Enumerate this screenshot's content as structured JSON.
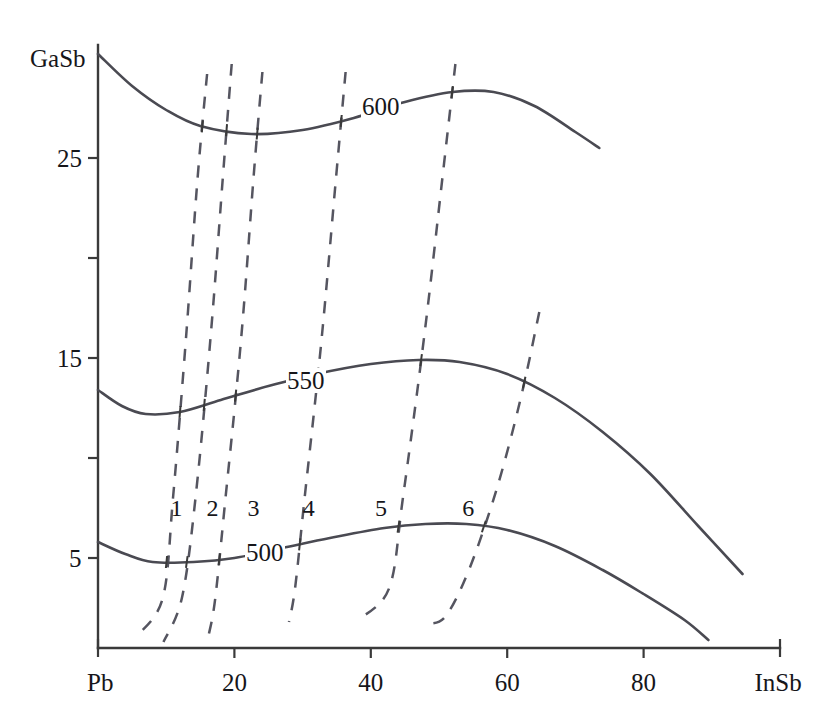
{
  "chart_data": {
    "type": "line",
    "title": "",
    "subtitle": "",
    "xlabel": "",
    "ylabel": "",
    "xlim": [
      0,
      100
    ],
    "ylim": [
      0.5,
      30.5
    ],
    "grid": false,
    "legend_position": "inline-on-curve",
    "x_axis": {
      "start_label": "Pb",
      "end_label": "InSb",
      "tick_labels": [
        "20",
        "40",
        "60",
        "80"
      ],
      "tick_values": [
        20,
        40,
        60,
        80
      ],
      "minor_ticks": []
    },
    "y_axis": {
      "top_label": "GaSb",
      "tick_labels": [
        "25",
        "15",
        "5"
      ],
      "tick_values": [
        25,
        15,
        5
      ],
      "unlabeled_tick_values": [
        20,
        10
      ]
    },
    "series": [
      {
        "name": "600",
        "label": "600",
        "style": "solid",
        "points": [
          [
            0.0,
            30.2
          ],
          [
            5.0,
            28.6
          ],
          [
            10.0,
            27.4
          ],
          [
            15.0,
            26.6
          ],
          [
            22.5,
            26.2
          ],
          [
            30.0,
            26.4
          ],
          [
            37.5,
            27.0
          ],
          [
            45.0,
            27.8
          ],
          [
            52.0,
            28.3
          ],
          [
            58.0,
            28.3
          ],
          [
            64.0,
            27.6
          ],
          [
            70.0,
            26.3
          ],
          [
            73.5,
            25.5
          ]
        ]
      },
      {
        "name": "550",
        "label": "550",
        "style": "solid",
        "points": [
          [
            0.0,
            13.4
          ],
          [
            3.5,
            12.6
          ],
          [
            7.0,
            12.2
          ],
          [
            12.0,
            12.3
          ],
          [
            18.0,
            12.9
          ],
          [
            25.0,
            13.6
          ],
          [
            32.0,
            14.2
          ],
          [
            40.0,
            14.7
          ],
          [
            47.0,
            14.9
          ],
          [
            53.0,
            14.8
          ],
          [
            60.0,
            14.2
          ],
          [
            67.0,
            13.0
          ],
          [
            74.0,
            11.3
          ],
          [
            81.0,
            9.2
          ],
          [
            88.0,
            6.6
          ],
          [
            94.5,
            4.2
          ]
        ]
      },
      {
        "name": "500",
        "label": "500",
        "style": "solid",
        "points": [
          [
            0.0,
            5.8
          ],
          [
            4.0,
            5.2
          ],
          [
            8.0,
            4.8
          ],
          [
            14.0,
            4.8
          ],
          [
            20.0,
            5.0
          ],
          [
            27.0,
            5.5
          ],
          [
            34.0,
            6.0
          ],
          [
            42.0,
            6.5
          ],
          [
            48.0,
            6.7
          ],
          [
            54.0,
            6.7
          ],
          [
            60.0,
            6.4
          ],
          [
            67.0,
            5.6
          ],
          [
            74.0,
            4.4
          ],
          [
            80.0,
            3.2
          ],
          [
            86.0,
            1.9
          ],
          [
            89.5,
            0.9
          ]
        ]
      }
    ],
    "tie_lines": [
      {
        "name": "1",
        "label": "1",
        "style": "dashed",
        "points": [
          [
            16.0,
            29.2
          ],
          [
            14.6,
            24.0
          ],
          [
            12.9,
            16.0
          ],
          [
            11.0,
            8.0
          ],
          [
            9.5,
            3.0
          ],
          [
            5.7,
            1.1
          ]
        ]
      },
      {
        "name": "2",
        "label": "2",
        "style": "dashed",
        "points": [
          [
            19.6,
            29.7
          ],
          [
            18.3,
            24.0
          ],
          [
            16.5,
            16.0
          ],
          [
            14.3,
            8.0
          ],
          [
            12.3,
            3.0
          ],
          [
            9.6,
            0.8
          ]
        ]
      },
      {
        "name": "3",
        "label": "3",
        "style": "dashed",
        "points": [
          [
            24.1,
            29.3
          ],
          [
            22.8,
            24.0
          ],
          [
            21.0,
            16.0
          ],
          [
            18.7,
            8.0
          ],
          [
            17.2,
            3.0
          ],
          [
            16.2,
            1.1
          ]
        ]
      },
      {
        "name": "4",
        "label": "4",
        "style": "dashed",
        "points": [
          [
            36.3,
            29.3
          ],
          [
            34.9,
            24.0
          ],
          [
            32.8,
            16.0
          ],
          [
            30.3,
            8.0
          ],
          [
            28.9,
            3.5
          ],
          [
            28.0,
            1.8
          ]
        ]
      },
      {
        "name": "5",
        "label": "5",
        "style": "dashed",
        "points": [
          [
            52.4,
            29.7
          ],
          [
            50.5,
            24.0
          ],
          [
            47.8,
            16.0
          ],
          [
            44.7,
            8.0
          ],
          [
            42.7,
            3.5
          ],
          [
            38.1,
            1.9
          ]
        ]
      },
      {
        "name": "6",
        "label": "6",
        "style": "dashed",
        "points": [
          [
            64.7,
            17.3
          ],
          [
            62.0,
            13.0
          ],
          [
            58.5,
            8.5
          ],
          [
            54.5,
            4.5
          ],
          [
            51.0,
            2.1
          ],
          [
            48.2,
            1.7
          ]
        ]
      }
    ],
    "series_label_positions": [
      {
        "label": "1",
        "x": 11.5,
        "y": 7.5
      },
      {
        "label": "2",
        "x": 16.8,
        "y": 7.5
      },
      {
        "label": "3",
        "x": 22.8,
        "y": 7.5
      },
      {
        "label": "4",
        "x": 30.9,
        "y": 7.5
      },
      {
        "label": "5",
        "x": 41.5,
        "y": 7.5
      },
      {
        "label": "6",
        "x": 54.3,
        "y": 7.5
      }
    ],
    "contour_label_positions": [
      {
        "label": "600",
        "x": 41.5,
        "y": 27.6
      },
      {
        "label": "550",
        "x": 30.5,
        "y": 13.9
      },
      {
        "label": "500",
        "x": 24.5,
        "y": 5.3
      }
    ],
    "colors": {
      "axis": "#3a3a3a",
      "isotherm": "#4a4a52",
      "tieline": "#555560",
      "background": "#ffffff",
      "text": "#16161a"
    }
  },
  "axis": {
    "y_top_label": "GaSb",
    "x_start_label": "Pb",
    "x_end_label": "InSb",
    "y_ticks": [
      "25",
      "15",
      "5"
    ],
    "x_ticks": [
      "20",
      "40",
      "60",
      "80"
    ]
  }
}
